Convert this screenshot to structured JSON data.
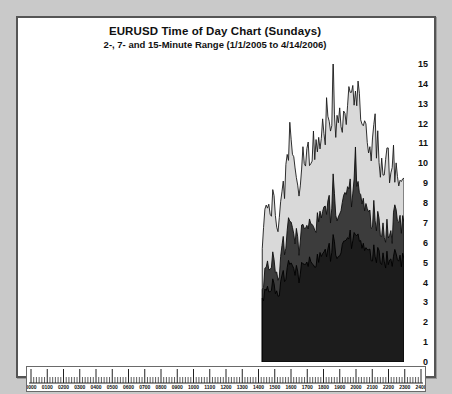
{
  "chart_data": {
    "type": "area",
    "title": "EURUSD Time of Day Chart (Sundays)",
    "subtitle": "2-, 7- and 15-Minute Range (1/1/2005 to 4/14/2006)",
    "xlabel": "",
    "ylabel": "",
    "ylim": [
      0,
      15
    ],
    "yticks": [
      0,
      1,
      2,
      3,
      4,
      5,
      6,
      7,
      8,
      9,
      10,
      11,
      12,
      13,
      14,
      15
    ],
    "ytick_labels": [
      "0",
      "1",
      "2",
      "3",
      "4",
      "5",
      "6",
      "7",
      "8",
      "9",
      "10",
      "11",
      "12",
      "13",
      "14",
      "15"
    ],
    "xlim": [
      "0000",
      "2400"
    ],
    "xticks": [
      "0000",
      "0100",
      "0200",
      "0300",
      "0400",
      "0500",
      "0600",
      "0700",
      "0800",
      "0900",
      "1000",
      "1100",
      "1200",
      "1300",
      "1400",
      "1500",
      "1600",
      "1700",
      "1800",
      "1900",
      "2000",
      "2100",
      "2200",
      "2300",
      "2400"
    ],
    "grid": false,
    "legend_position": "none",
    "axis_position": "right",
    "data_start_time": "1500",
    "data_end_time": "2400",
    "note": "Data present only from 1500 to 2400; earlier hours are empty (market closed on Sundays).",
    "series": [
      {
        "name": "15-Minute Range",
        "color": "#d9d9d9",
        "line_color": "#1a1a1a",
        "peak_value": 14.4,
        "x": [
          "1500",
          "1505",
          "1510",
          "1515",
          "1520",
          "1525",
          "1530",
          "1535",
          "1540",
          "1545",
          "1550",
          "1555",
          "1600",
          "1605",
          "1610",
          "1615",
          "1620",
          "1625",
          "1630",
          "1635",
          "1640",
          "1645",
          "1650",
          "1655",
          "1700",
          "1705",
          "1710",
          "1715",
          "1720",
          "1725",
          "1730",
          "1735",
          "1740",
          "1745",
          "1750",
          "1755",
          "1800",
          "1805",
          "1810",
          "1815",
          "1820",
          "1825",
          "1830",
          "1835",
          "1840",
          "1845",
          "1850",
          "1855",
          "1900",
          "1905",
          "1910",
          "1915",
          "1920",
          "1925",
          "1930",
          "1935",
          "1940",
          "1945",
          "1950",
          "1955",
          "2000",
          "2005",
          "2010",
          "2015",
          "2020",
          "2025",
          "2030",
          "2035",
          "2040",
          "2045",
          "2050",
          "2055",
          "2100",
          "2105",
          "2110",
          "2115",
          "2120",
          "2125",
          "2130",
          "2135",
          "2140",
          "2145",
          "2150",
          "2155",
          "2200",
          "2205",
          "2210",
          "2215",
          "2220",
          "2225",
          "2230",
          "2235",
          "2240",
          "2245",
          "2250",
          "2255",
          "2300",
          "2305",
          "2310",
          "2315",
          "2320",
          "2325",
          "2330",
          "2335",
          "2340",
          "2345",
          "2350",
          "2355",
          "2400"
        ],
        "values": [
          5.6,
          6.4,
          7.3,
          7.9,
          8.3,
          8.0,
          7.4,
          7.8,
          8.4,
          8.2,
          7.6,
          7.0,
          6.6,
          7.1,
          7.8,
          8.6,
          9.2,
          8.8,
          9.6,
          10.4,
          11.0,
          11.6,
          11.2,
          10.4,
          9.8,
          9.4,
          10.0,
          9.6,
          9.0,
          9.6,
          10.2,
          10.8,
          10.4,
          9.8,
          10.4,
          11.0,
          10.6,
          10.2,
          10.8,
          11.4,
          11.0,
          10.6,
          11.2,
          11.8,
          11.4,
          11.0,
          11.6,
          12.2,
          11.8,
          12.4,
          13.0,
          12.4,
          11.8,
          12.4,
          14.4,
          13.0,
          12.0,
          11.6,
          12.0,
          12.6,
          12.2,
          11.8,
          12.4,
          13.0,
          12.6,
          13.4,
          14.0,
          13.4,
          12.8,
          13.2,
          13.8,
          13.4,
          12.8,
          13.4,
          13.0,
          12.4,
          12.8,
          12.4,
          11.8,
          12.2,
          11.6,
          11.0,
          11.4,
          10.8,
          11.2,
          12.4,
          11.6,
          10.8,
          11.0,
          10.4,
          10.0,
          10.4,
          10.0,
          9.6,
          10.0,
          10.4,
          10.0,
          9.6,
          10.0,
          9.6,
          10.2,
          9.8,
          10.2,
          9.8,
          9.6,
          9.4,
          9.2,
          9.4,
          9.2
        ]
      },
      {
        "name": "7-Minute Range",
        "color": "#3c3c3c",
        "line_color": "#0d0d0d",
        "peak_value": 10.3,
        "x": [
          "1500",
          "1505",
          "1510",
          "1515",
          "1520",
          "1525",
          "1530",
          "1535",
          "1540",
          "1545",
          "1550",
          "1555",
          "1600",
          "1605",
          "1610",
          "1615",
          "1620",
          "1625",
          "1630",
          "1635",
          "1640",
          "1645",
          "1650",
          "1655",
          "1700",
          "1705",
          "1710",
          "1715",
          "1720",
          "1725",
          "1730",
          "1735",
          "1740",
          "1745",
          "1750",
          "1755",
          "1800",
          "1805",
          "1810",
          "1815",
          "1820",
          "1825",
          "1830",
          "1835",
          "1840",
          "1845",
          "1850",
          "1855",
          "1900",
          "1905",
          "1910",
          "1915",
          "1920",
          "1925",
          "1930",
          "1935",
          "1940",
          "1945",
          "1950",
          "1955",
          "2000",
          "2005",
          "2010",
          "2015",
          "2020",
          "2025",
          "2030",
          "2035",
          "2040",
          "2045",
          "2050",
          "2055",
          "2100",
          "2105",
          "2110",
          "2115",
          "2120",
          "2125",
          "2130",
          "2135",
          "2140",
          "2145",
          "2150",
          "2155",
          "2200",
          "2205",
          "2210",
          "2215",
          "2220",
          "2225",
          "2230",
          "2235",
          "2240",
          "2245",
          "2250",
          "2255",
          "2300",
          "2305",
          "2310",
          "2315",
          "2320",
          "2325",
          "2330",
          "2335",
          "2340",
          "2345",
          "2350",
          "2355",
          "2400"
        ],
        "values": [
          3.4,
          3.9,
          4.5,
          4.9,
          5.2,
          5.0,
          4.6,
          4.9,
          5.3,
          5.1,
          4.7,
          4.3,
          4.1,
          4.5,
          5.0,
          5.5,
          5.9,
          5.6,
          6.2,
          6.7,
          7.1,
          7.5,
          7.2,
          6.7,
          6.3,
          6.0,
          6.5,
          6.2,
          5.8,
          6.2,
          6.6,
          7.0,
          6.7,
          6.3,
          6.7,
          7.1,
          6.8,
          6.6,
          7.0,
          7.4,
          7.1,
          6.8,
          7.2,
          7.6,
          7.3,
          7.1,
          7.5,
          7.9,
          7.6,
          8.0,
          8.4,
          8.0,
          7.6,
          8.0,
          9.3,
          8.4,
          7.7,
          7.5,
          7.7,
          8.1,
          7.9,
          7.6,
          8.0,
          8.4,
          8.1,
          8.6,
          9.0,
          8.6,
          8.2,
          8.5,
          8.9,
          10.3,
          8.2,
          8.6,
          8.4,
          8.0,
          8.2,
          8.0,
          7.6,
          7.9,
          7.5,
          7.1,
          7.4,
          7.0,
          7.2,
          8.0,
          7.5,
          7.0,
          7.1,
          6.7,
          6.5,
          6.7,
          6.5,
          6.2,
          6.5,
          6.7,
          6.5,
          6.2,
          6.5,
          6.2,
          7.8,
          7.4,
          7.6,
          7.3,
          7.2,
          7.0,
          6.9,
          7.0,
          6.9
        ]
      },
      {
        "name": "2-Minute Range",
        "color": "#1c1c1c",
        "line_color": "#000000",
        "peak_value": 6.4,
        "x": [
          "1500",
          "1505",
          "1510",
          "1515",
          "1520",
          "1525",
          "1530",
          "1535",
          "1540",
          "1545",
          "1550",
          "1555",
          "1600",
          "1605",
          "1610",
          "1615",
          "1620",
          "1625",
          "1630",
          "1635",
          "1640",
          "1645",
          "1650",
          "1655",
          "1700",
          "1705",
          "1710",
          "1715",
          "1720",
          "1725",
          "1730",
          "1735",
          "1740",
          "1745",
          "1750",
          "1755",
          "1800",
          "1805",
          "1810",
          "1815",
          "1820",
          "1825",
          "1830",
          "1835",
          "1840",
          "1845",
          "1850",
          "1855",
          "1900",
          "1905",
          "1910",
          "1915",
          "1920",
          "1925",
          "1930",
          "1935",
          "1940",
          "1945",
          "1950",
          "1955",
          "2000",
          "2005",
          "2010",
          "2015",
          "2020",
          "2025",
          "2030",
          "2035",
          "2040",
          "2045",
          "2050",
          "2055",
          "2100",
          "2105",
          "2110",
          "2115",
          "2120",
          "2125",
          "2130",
          "2135",
          "2140",
          "2145",
          "2150",
          "2155",
          "2200",
          "2205",
          "2210",
          "2215",
          "2220",
          "2225",
          "2230",
          "2235",
          "2240",
          "2245",
          "2250",
          "2255",
          "2300",
          "2305",
          "2310",
          "2315",
          "2320",
          "2325",
          "2330",
          "2335",
          "2340",
          "2345",
          "2350",
          "2355",
          "2400"
        ],
        "values": [
          3.0,
          3.2,
          3.5,
          3.7,
          3.9,
          3.8,
          3.5,
          3.7,
          4.0,
          3.9,
          3.6,
          3.4,
          3.3,
          3.5,
          3.8,
          4.1,
          4.3,
          4.2,
          4.5,
          4.8,
          5.0,
          5.2,
          5.1,
          4.8,
          4.6,
          4.4,
          4.7,
          4.5,
          4.3,
          4.5,
          4.8,
          5.0,
          4.9,
          4.6,
          4.9,
          5.1,
          5.0,
          4.8,
          5.0,
          5.3,
          5.1,
          5.0,
          5.2,
          5.4,
          5.3,
          5.2,
          5.4,
          5.6,
          5.5,
          5.7,
          5.9,
          5.7,
          5.5,
          5.7,
          6.3,
          6.0,
          5.6,
          5.5,
          5.6,
          5.8,
          5.7,
          5.6,
          5.8,
          6.0,
          5.9,
          6.1,
          6.4,
          6.2,
          6.0,
          6.1,
          6.3,
          6.1,
          5.9,
          6.1,
          6.0,
          5.8,
          5.9,
          5.8,
          5.6,
          5.7,
          5.5,
          5.3,
          5.5,
          5.3,
          5.4,
          5.8,
          5.6,
          5.3,
          5.4,
          5.2,
          5.1,
          5.2,
          5.1,
          5.0,
          5.1,
          5.2,
          5.1,
          5.0,
          5.1,
          5.0,
          5.5,
          5.3,
          5.4,
          5.3,
          5.2,
          5.1,
          5.1,
          5.2,
          5.1
        ]
      }
    ]
  }
}
